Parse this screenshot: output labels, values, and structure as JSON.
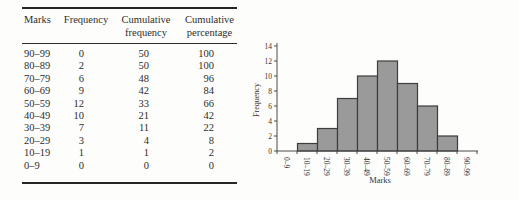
{
  "table": {
    "headers": [
      [
        "Marks"
      ],
      [
        "Frequency"
      ],
      [
        "Cumulative",
        "frequency"
      ],
      [
        "Cumulative",
        "percentage"
      ]
    ],
    "rows": [
      [
        "90–99",
        "0",
        "50",
        "100"
      ],
      [
        "80–89",
        "2",
        "50",
        "100"
      ],
      [
        "70–79",
        "6",
        "48",
        "96"
      ],
      [
        "60–69",
        "9",
        "42",
        "84"
      ],
      [
        "50–59",
        "12",
        "33",
        "66"
      ],
      [
        "40–49",
        "10",
        "21",
        "42"
      ],
      [
        "30–39",
        "7",
        "11",
        "22"
      ],
      [
        "20–29",
        "3",
        "4",
        "8"
      ],
      [
        "10–19",
        "1",
        "1",
        "2"
      ],
      [
        "0–9",
        "0",
        "0",
        "0"
      ]
    ]
  },
  "chart_data": {
    "type": "bar",
    "title": "",
    "categories": [
      "0–9",
      "10–19",
      "20–29",
      "30–39",
      "40–49",
      "50–59",
      "60–69",
      "70–79",
      "80–89",
      "90–99"
    ],
    "values": [
      0,
      1,
      3,
      7,
      10,
      12,
      9,
      6,
      2,
      0
    ],
    "xlabel": "Marks",
    "ylabel": "Frequency",
    "ylim": [
      0,
      14
    ],
    "ytick_step": 2,
    "grid": "off",
    "legend": "none",
    "bar_fill": "#9a9a9a",
    "bar_stroke": "#3d3d3d",
    "axis_color": "#4a4a4a"
  }
}
